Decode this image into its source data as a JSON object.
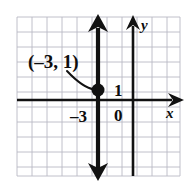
{
  "figure": {
    "type": "coordinate-plane-graph",
    "title": "",
    "background_color": "#ffffff",
    "grid": {
      "visible": true,
      "color": "#b9b9c4",
      "cell_size_px": 15,
      "left_px": 17,
      "top_px": 17,
      "right_px": 180,
      "bottom_px": 176
    },
    "axes": {
      "color": "#111111",
      "x_axis": {
        "label": "x",
        "y_px": 100,
        "start_px": 17,
        "end_px": 182,
        "arrow": "right"
      },
      "y_axis": {
        "label": "y",
        "x_px": 133,
        "start_px": 176,
        "end_px": 19,
        "arrow": "up"
      }
    },
    "tick_labels": [
      {
        "text": "1",
        "x_px": 120,
        "y_px": 95,
        "meaning": "y-value-one"
      },
      {
        "text": "0",
        "x_px": 120,
        "y_px": 117,
        "meaning": "origin-zero"
      },
      {
        "text": "–3",
        "x_px": 75,
        "y_px": 122,
        "meaning": "x-intercept-negative-three"
      }
    ],
    "graphed_line": {
      "equation": "x = -3",
      "description": "vertical line through x = -3",
      "color": "#111111",
      "x_px": 98,
      "top_px": 19,
      "bottom_px": 176,
      "arrow": "both",
      "stroke_width_px": 4
    },
    "plotted_point": {
      "label": "(–3, 1)",
      "coordinates": [
        -3,
        1
      ],
      "x_px": 98,
      "y_px": 90,
      "radius_px": 6,
      "color": "#111111"
    },
    "annotation": {
      "text": "(–3, 1)",
      "text_x_px": 28,
      "text_y_px": 68,
      "leader_line": {
        "from_px": [
          68,
          72
        ],
        "control_px": [
          82,
          86
        ],
        "to_px": [
          95,
          89
        ]
      }
    }
  }
}
